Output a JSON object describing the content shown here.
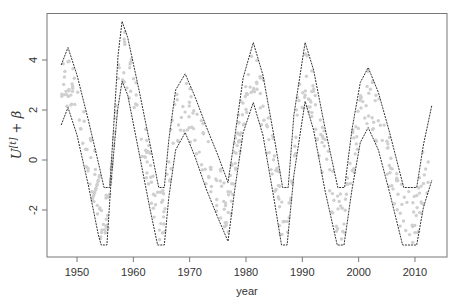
{
  "chart_data": {
    "type": "line",
    "title": "",
    "xlabel": "year",
    "ylabel": "U^[t] + β",
    "xlim": [
      1944.6,
      2015.7
    ],
    "ylim": [
      -3.8,
      5.9
    ],
    "x_ticks": [
      1950,
      1960,
      1970,
      1980,
      1990,
      2000,
      2010
    ],
    "y_ticks": [
      -2,
      0,
      2,
      4
    ],
    "grid": false,
    "legend": null,
    "series": [
      {
        "name": "upper bound",
        "style": "dashed-dark",
        "points": [
          [
            1947.2,
            3.8
          ],
          [
            1948.4,
            4.5
          ],
          [
            1950,
            3.4
          ],
          [
            1952,
            1.6
          ],
          [
            1954,
            -0.3
          ],
          [
            1954.8,
            -1.1
          ],
          [
            1955.8,
            -1.1
          ],
          [
            1956.5,
            1.3
          ],
          [
            1957.3,
            4.2
          ],
          [
            1958.0,
            5.55
          ],
          [
            1959,
            4.9
          ],
          [
            1961,
            2.8
          ],
          [
            1963,
            0.6
          ],
          [
            1964.5,
            -1.1
          ],
          [
            1965.5,
            -1.1
          ],
          [
            1966.3,
            0.8
          ],
          [
            1967.5,
            2.8
          ],
          [
            1969.2,
            3.45
          ],
          [
            1971,
            2.5
          ],
          [
            1973,
            1.3
          ],
          [
            1975,
            0.2
          ],
          [
            1976.8,
            -0.9
          ],
          [
            1978,
            0.9
          ],
          [
            1979.5,
            3.3
          ],
          [
            1981.3,
            4.7
          ],
          [
            1983,
            3.4
          ],
          [
            1985,
            0.9
          ],
          [
            1986.5,
            -1.1
          ],
          [
            1987.5,
            -1.1
          ],
          [
            1988.5,
            1.8
          ],
          [
            1990.5,
            4.7
          ],
          [
            1992,
            3.6
          ],
          [
            1994,
            1.3
          ],
          [
            1996.3,
            -1.1
          ],
          [
            1997.5,
            -1.1
          ],
          [
            1998.8,
            1.2
          ],
          [
            2000.3,
            3.1
          ],
          [
            2001.7,
            3.7
          ],
          [
            2003.5,
            2.7
          ],
          [
            2005.5,
            1.1
          ],
          [
            2008,
            -1.1
          ],
          [
            2010.3,
            -1.1
          ],
          [
            2011.5,
            0.6
          ],
          [
            2013,
            2.2
          ]
        ]
      },
      {
        "name": "lower bound",
        "style": "dashed-dark",
        "points": [
          [
            1947.2,
            1.4
          ],
          [
            1948.4,
            2.1
          ],
          [
            1950,
            1.0
          ],
          [
            1952,
            -1.0
          ],
          [
            1953.8,
            -3.0
          ],
          [
            1954.3,
            -3.4
          ],
          [
            1955.3,
            -3.4
          ],
          [
            1956,
            -1.0
          ],
          [
            1957.2,
            2.0
          ],
          [
            1958.0,
            3.15
          ],
          [
            1959,
            2.6
          ],
          [
            1961,
            0.3
          ],
          [
            1963,
            -2.0
          ],
          [
            1964.3,
            -3.4
          ],
          [
            1965.5,
            -3.4
          ],
          [
            1966.3,
            -1.5
          ],
          [
            1967.5,
            0.4
          ],
          [
            1969.2,
            1.1
          ],
          [
            1971,
            0.1
          ],
          [
            1973,
            -1.2
          ],
          [
            1975,
            -2.3
          ],
          [
            1976.8,
            -3.25
          ],
          [
            1978,
            -1.2
          ],
          [
            1979.5,
            1.1
          ],
          [
            1981.3,
            2.3
          ],
          [
            1983,
            1.0
          ],
          [
            1985,
            -1.6
          ],
          [
            1986.3,
            -3.4
          ],
          [
            1987.3,
            -3.4
          ],
          [
            1988.5,
            -0.6
          ],
          [
            1990.5,
            2.35
          ],
          [
            1992,
            1.2
          ],
          [
            1994,
            -1.2
          ],
          [
            1996.2,
            -3.4
          ],
          [
            1997.4,
            -3.4
          ],
          [
            1998.8,
            -1.2
          ],
          [
            2000.3,
            0.7
          ],
          [
            2001.7,
            1.3
          ],
          [
            2003.5,
            0.4
          ],
          [
            2005.5,
            -1.3
          ],
          [
            2007.8,
            -3.4
          ],
          [
            2010.3,
            -3.4
          ],
          [
            2011.5,
            -1.9
          ],
          [
            2013,
            -0.8
          ]
        ]
      },
      {
        "name": "observations",
        "style": "light-gray-points",
        "description": "scattered light gray dots lying between the two bounding curves"
      }
    ]
  },
  "axes": {
    "xlabel": "year",
    "ylabel_main": "U",
    "ylabel_sup": "[t]",
    "ylabel_rest": " + β",
    "x_tick_labels": [
      "1950",
      "1960",
      "1970",
      "1980",
      "1990",
      "2000",
      "2010"
    ],
    "y_tick_labels": [
      "-2",
      "0",
      "2",
      "4"
    ]
  },
  "colors": {
    "frame": "#777777",
    "curve": "#333333",
    "points": "#cfcfcf",
    "text": "#333333"
  }
}
